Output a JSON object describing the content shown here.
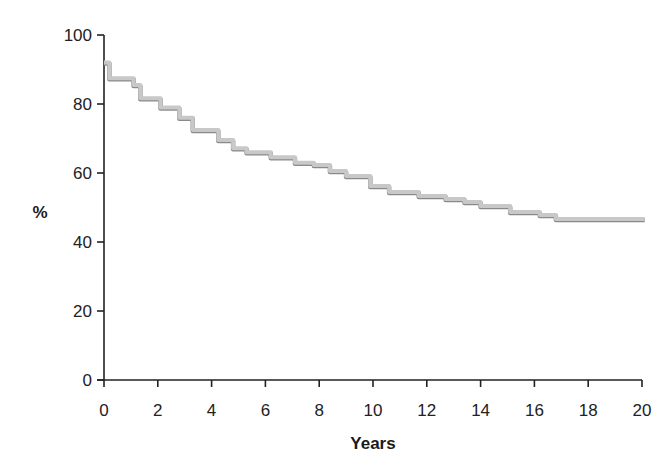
{
  "chart_data": {
    "type": "line",
    "subtype": "step (Kaplan-Meier survival curve)",
    "title": "",
    "xlabel": "Years",
    "ylabel": "%",
    "xlim": [
      0,
      20
    ],
    "ylim": [
      0,
      100
    ],
    "x_ticks": [
      0,
      2,
      4,
      6,
      8,
      10,
      12,
      14,
      16,
      18,
      20
    ],
    "y_ticks": [
      0,
      20,
      40,
      60,
      80,
      100
    ],
    "grid": false,
    "legend": null,
    "series": [
      {
        "name": "Survival",
        "color": "#c8c8c8",
        "edge_color": "#8a8a8a",
        "x": [
          0.0,
          0.2,
          1.1,
          1.35,
          2.1,
          2.8,
          3.3,
          4.25,
          4.8,
          5.3,
          6.2,
          7.1,
          7.8,
          8.4,
          9.0,
          9.9,
          10.6,
          11.7,
          12.7,
          13.4,
          14.0,
          15.1,
          16.2,
          16.8,
          20.1
        ],
        "values": [
          92,
          87.5,
          85.5,
          81.7,
          79,
          76,
          72.5,
          69.6,
          67.2,
          66,
          64.6,
          63,
          62.3,
          60.6,
          59.1,
          56.2,
          54.5,
          53.3,
          52.5,
          51.6,
          50.4,
          48.7,
          47.8,
          46.7,
          46.7
        ]
      }
    ]
  },
  "layout": {
    "plot_left": 104,
    "plot_right": 642,
    "plot_top": 35,
    "plot_bottom": 380
  }
}
